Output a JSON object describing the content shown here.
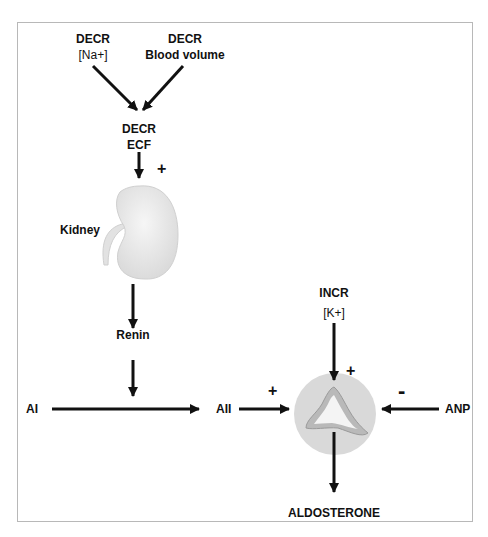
{
  "diagram": {
    "nodes": {
      "decr_na": {
        "line1": "DECR",
        "line2": "[Na+]"
      },
      "decr_blood": {
        "line1": "DECR",
        "line2": "Blood volume"
      },
      "decr_ecf": {
        "line1": "DECR",
        "line2": "ECF"
      },
      "kidney": {
        "label": "Kidney"
      },
      "renin": {
        "label": "Renin"
      },
      "ai": {
        "label": "AI"
      },
      "aii": {
        "label": "AII"
      },
      "incr_k": {
        "line1": "INCR",
        "line2": "[K+]"
      },
      "anp": {
        "label": "ANP"
      },
      "aldosterone": {
        "label": "ALDOSTERONE"
      }
    },
    "signs": {
      "ecf_to_kidney": "+",
      "aii_to_adrenal": "+",
      "k_to_adrenal": "+",
      "anp_to_adrenal": "-"
    },
    "edges": [
      {
        "from": "DECR [Na+]",
        "to": "DECR ECF"
      },
      {
        "from": "DECR Blood volume",
        "to": "DECR ECF"
      },
      {
        "from": "DECR ECF",
        "to": "Kidney",
        "sign": "+"
      },
      {
        "from": "Kidney",
        "to": "Renin"
      },
      {
        "from": "Renin",
        "to": "AI→AII conversion"
      },
      {
        "from": "AI",
        "to": "AII"
      },
      {
        "from": "AII",
        "to": "Adrenal",
        "sign": "+"
      },
      {
        "from": "INCR [K+]",
        "to": "Adrenal",
        "sign": "+"
      },
      {
        "from": "ANP",
        "to": "Adrenal",
        "sign": "-"
      },
      {
        "from": "Adrenal",
        "to": "ALDOSTERONE"
      }
    ],
    "colors": {
      "arrow": "#111111",
      "adrenal_circle": "#d9d9d9",
      "kidney": "#ececec",
      "border": "#b8b8b8"
    }
  }
}
